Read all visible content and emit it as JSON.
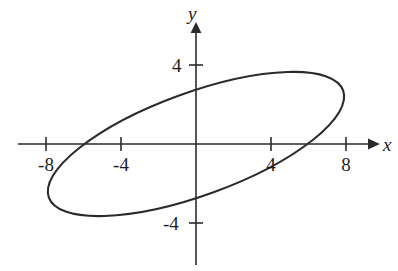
{
  "figure": {
    "background_color": "#ffffff",
    "stroke_color": "#2b2b2b",
    "axis_labels": {
      "x": "x",
      "y": "y"
    }
  },
  "chart_data": {
    "type": "line",
    "title": "",
    "subtitle": "",
    "xlabel": "x",
    "ylabel": "y",
    "xlim": [
      -10.5,
      10.8
    ],
    "ylim": [
      -7.3,
      6.4
    ],
    "grid": false,
    "legend": null,
    "annotations": [],
    "xticks": [
      -8,
      -4,
      4,
      8
    ],
    "xtick_labels": [
      "-8",
      "-4",
      "4",
      "8"
    ],
    "yticks": [
      4,
      -4
    ],
    "ytick_labels": [
      "4",
      "-4"
    ],
    "series": [
      {
        "name": "rotated-ellipse",
        "shape": "ellipse",
        "center": [
          0,
          0
        ],
        "semi_major_axis": 8.35,
        "semi_minor_axis": 2.6,
        "rotation_degrees": -20,
        "x_intercepts": [
          -6.6,
          6.7
        ],
        "y_intercepts": [
          2.48,
          -2.43
        ],
        "extreme_points": {
          "leftmost": [
            -8.15,
            2.2
          ],
          "rightmost": [
            8.2,
            -2.2
          ],
          "topmost": [
            -4.1,
            3.05
          ],
          "bottommost": [
            4.2,
            -3.05
          ]
        }
      }
    ]
  }
}
